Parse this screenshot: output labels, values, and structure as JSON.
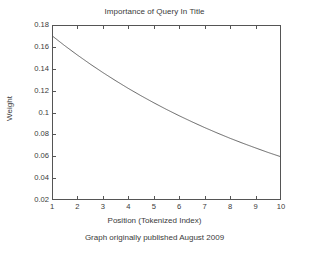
{
  "chart_data": {
    "type": "line",
    "title": "Importance of Query In Title",
    "xlabel": "Position (Tokenized Index)",
    "ylabel": "Weight",
    "xlim": [
      1,
      10
    ],
    "ylim": [
      0.02,
      0.18
    ],
    "grid": false,
    "legend_position": "none",
    "annotation": "Google Best Fit (−0.003 − 0.078*0.99ˣ + 0.278*0.9ˣ)",
    "annotation_parts": {
      "prefix": "Google Best Fit (−0.003 − 0.078*0.99",
      "exp1": "x",
      "middle": " + 0.278*0.9",
      "exp2": "x",
      "suffix": ")"
    },
    "caption": "Graph originally published August 2009",
    "xticks": [
      1,
      2,
      3,
      4,
      5,
      6,
      7,
      8,
      9,
      10
    ],
    "xtick_labels": [
      "1",
      "2",
      "3",
      "4",
      "5",
      "6",
      "7",
      "8",
      "9",
      "10"
    ],
    "yticks": [
      0.02,
      0.04,
      0.06,
      0.08,
      0.1,
      0.12,
      0.14,
      0.16,
      0.18
    ],
    "ytick_labels": [
      "0.02",
      "0.04",
      "0.06",
      "0.08",
      "0.1",
      "0.12",
      "0.14",
      "0.16",
      "0.18"
    ],
    "series": [
      {
        "name": "Google Best Fit",
        "color": "#555555",
        "x": [
          1,
          1.5,
          2,
          2.5,
          3,
          3.5,
          4,
          4.5,
          5,
          5.5,
          6,
          6.5,
          7,
          7.5,
          8,
          8.5,
          9,
          9.5,
          10
        ],
        "values": [
          0.1702,
          0.1611,
          0.1525,
          0.1443,
          0.1365,
          0.1291,
          0.122,
          0.1153,
          0.1089,
          0.1028,
          0.097,
          0.0915,
          0.0862,
          0.0812,
          0.0764,
          0.0719,
          0.0676,
          0.0634,
          0.0595
        ]
      }
    ],
    "line_color": "#555555",
    "axis_color": "#555555",
    "background": "#ffffff"
  }
}
